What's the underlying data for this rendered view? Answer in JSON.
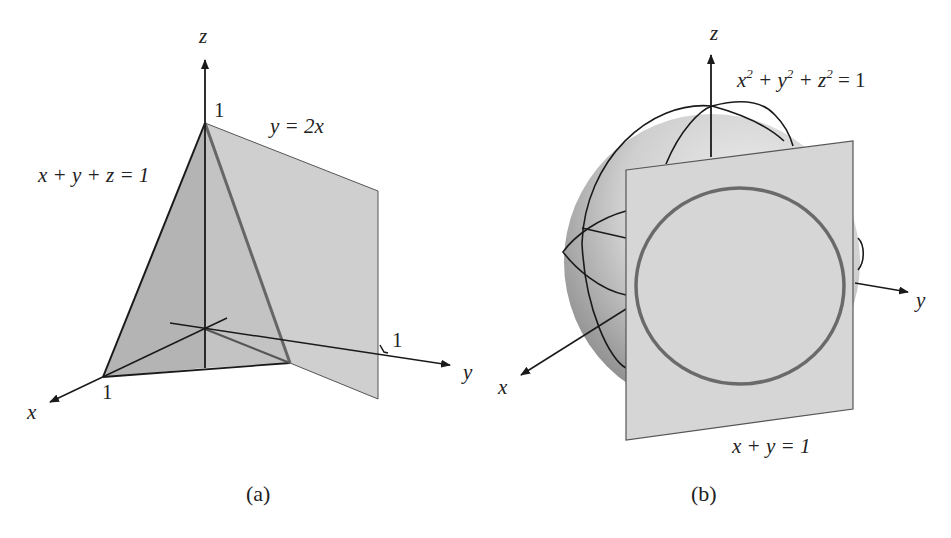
{
  "figure_a": {
    "caption": "(a)",
    "axis_labels": {
      "x": "x",
      "y": "y",
      "z": "z"
    },
    "tick_labels": {
      "x_one": "1",
      "y_one": "1",
      "z_one": "1"
    },
    "plane_labels": {
      "tilted_plane": "x + y + z = 1",
      "vertical_plane": "y = 2x"
    }
  },
  "figure_b": {
    "caption": "(b)",
    "axis_labels": {
      "x": "x",
      "y": "y",
      "z": "z"
    },
    "sphere_label": {
      "base": "x",
      "e1": "2",
      "p1": " + y",
      "e2": "2",
      "p2": " + z",
      "e3": "2",
      "tail": " = 1"
    },
    "plane_label": "x + y = 1"
  },
  "colors": {
    "tilted_plane_fill": "#b9b9b9",
    "vertical_plane_fill": "#cfcfcf",
    "sphere_fill_light": "#e2e2e2",
    "sphere_fill_dark": "#8e8e8e",
    "plane_b_fill": "#d6d6d6",
    "intersection_curve": "#6a6a6a",
    "axis_stroke": "#1a1a1a"
  }
}
